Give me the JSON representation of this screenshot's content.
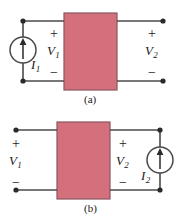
{
  "figure": {
    "wire_color": "#4a4a4a",
    "box_fill": "#d4707c",
    "box_stroke": "#8a5560",
    "text_color": "#1a1a1a"
  },
  "panel_a": {
    "caption": "(a)",
    "source": {
      "name": "current-source",
      "label": "I",
      "subscript": "1",
      "arrow_direction": "up",
      "position": "left"
    },
    "input_port": {
      "voltage_label": "V",
      "voltage_subscript": "1",
      "plus": "+",
      "minus": "−"
    },
    "output_port": {
      "voltage_label": "V",
      "voltage_subscript": "2",
      "plus": "+",
      "minus": "−",
      "terminals": "open"
    },
    "network_box": {
      "label": "",
      "fill": "#d4707c"
    }
  },
  "panel_b": {
    "caption": "(b)",
    "source": {
      "name": "current-source",
      "label": "I",
      "subscript": "2",
      "arrow_direction": "up",
      "position": "right"
    },
    "input_port": {
      "voltage_label": "V",
      "voltage_subscript": "1",
      "plus": "+",
      "minus": "−",
      "terminals": "open"
    },
    "output_port": {
      "voltage_label": "V",
      "voltage_subscript": "2",
      "plus": "+",
      "minus": "−"
    },
    "network_box": {
      "label": "",
      "fill": "#d4707c"
    }
  }
}
